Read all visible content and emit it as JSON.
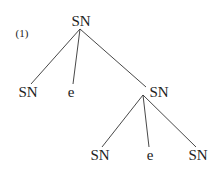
{
  "example_number": "(1)",
  "tree": {
    "root": {
      "label": "SN"
    },
    "level1": [
      {
        "label": "SN"
      },
      {
        "label": "e"
      },
      {
        "label": "SN"
      }
    ],
    "level2": [
      {
        "label": "SN"
      },
      {
        "label": "e"
      },
      {
        "label": "SN"
      }
    ]
  }
}
